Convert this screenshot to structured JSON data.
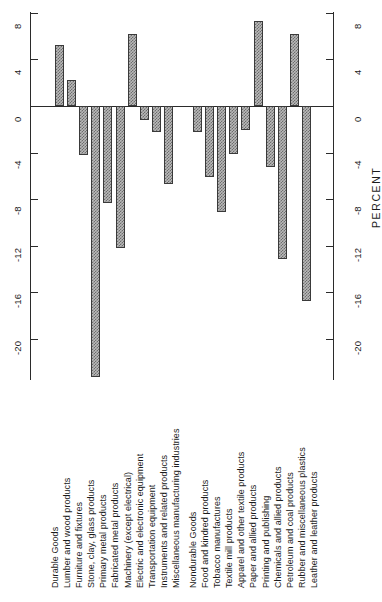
{
  "chart": {
    "type": "bar",
    "title": "",
    "axis_title_right": "PERCENT",
    "axis_title_left": "",
    "orientation": "vertical-bars-rotated-labels",
    "ylabel": "PERCENT",
    "xlabel": "",
    "ylim": [
      -24,
      8
    ],
    "y_ticks": [
      "8",
      "4",
      "0",
      "-4",
      "-8",
      "-12",
      "-16",
      "-20"
    ],
    "grid": false,
    "legend": "none"
  },
  "chart_data": {
    "type": "bar",
    "title": "",
    "xlabel": "",
    "ylabel": "PERCENT",
    "ylim": [
      -24,
      8
    ],
    "yticks": [
      8,
      4,
      0,
      -4,
      -8,
      -12,
      -16,
      -20
    ],
    "grid": false,
    "legend_position": "none",
    "group_headers": [
      "Durable Goods",
      "Nondurable Goods"
    ],
    "groups": [
      {
        "name": "Durable Goods",
        "categories": [
          "Lumber and wood products",
          "Furniture and fixtures",
          "Stone, clay, glass products",
          "Primary metal products",
          "Fabricated metal products",
          "Machinery (except electrical)",
          "Electric and electronic equipment",
          "Transportation equipment",
          "Instruments and related products",
          "Miscellaneous manufacturing industries"
        ],
        "values": [
          5.2,
          2.2,
          -4.2,
          -23.3,
          -8.3,
          -12.2,
          6.2,
          -1.2,
          -2.2,
          -6.7
        ]
      },
      {
        "name": "Nondurable Goods",
        "categories": [
          "Food and kindred products",
          "Tobacco manufactures",
          "Textile mill products",
          "Apparel and other textile products",
          "Paper and allied products",
          "Printing and publishing",
          "Chemicals and allied products",
          "Petroleum and coal products",
          "Rubber and miscellaneous plastics",
          "Leather and leather products"
        ],
        "values": [
          -2.2,
          -6.1,
          -9.1,
          -4.1,
          -2.1,
          7.3,
          -5.2,
          -13.1,
          6.2,
          -16.7
        ]
      }
    ],
    "categories": [
      "Lumber and wood products",
      "Furniture and fixtures",
      "Stone, clay, glass products",
      "Primary metal products",
      "Fabricated metal products",
      "Machinery (except electrical)",
      "Electric and electronic equipment",
      "Transportation equipment",
      "Instruments and related products",
      "Miscellaneous manufacturing industries",
      "Food and kindred products",
      "Tobacco manufactures",
      "Textile mill products",
      "Apparel and other textile products",
      "Paper and allied products",
      "Printing and publishing",
      "Chemicals and allied products",
      "Petroleum and coal products",
      "Rubber and miscellaneous plastics",
      "Leather and leather products"
    ],
    "values": [
      5.2,
      2.2,
      -4.2,
      -23.3,
      -8.3,
      -12.2,
      6.2,
      -1.2,
      -2.2,
      -6.7,
      -2.2,
      -6.1,
      -9.1,
      -4.1,
      -2.1,
      7.3,
      -5.2,
      -13.1,
      6.2,
      -16.7
    ]
  },
  "axis_left": {
    "ticks": [
      "8",
      "4",
      "0",
      "-4",
      "-8",
      "-12",
      "-16",
      "-20"
    ]
  },
  "axis_right": {
    "ticks": [
      "8",
      "4",
      "0",
      "-4",
      "-8",
      "-12",
      "-16",
      "-20"
    ],
    "title": "PERCENT"
  },
  "labels": {
    "durable_header": "Durable Goods",
    "nondurable_header": "Nondurable Goods",
    "durable": [
      "Lumber and wood products",
      "Furniture and fixtures",
      "Stone, clay, glass products",
      "Primary metal products",
      "Fabricated metal products",
      "Machinery (except electrical)",
      "Electric and electronic equipment",
      "Transportation equipment",
      "Instruments and related products",
      "Miscellaneous manufacturing industries"
    ],
    "nondurable": [
      "Food and kindred products",
      "Tobacco manufactures",
      "Textile mill products",
      "Apparel and other textile products",
      "Paper and allied products",
      "Printing and publishing",
      "Chemicals and allied products",
      "Petroleum and coal products",
      "Rubber and miscellaneous plastics",
      "Leather and leather products"
    ]
  },
  "colors": {
    "bar_fill": "#b9b9b9",
    "bar_edge": "#3a3a3a",
    "axis": "#2b2b2b",
    "text": "#1b1b1b",
    "background": "#ffffff"
  }
}
